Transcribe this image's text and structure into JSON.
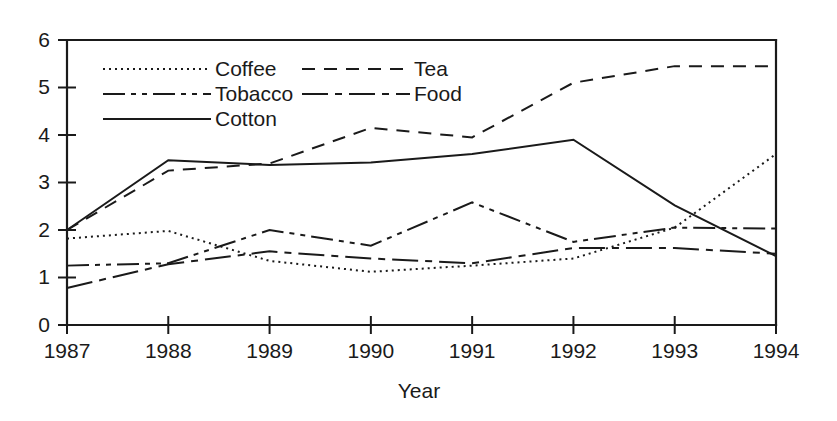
{
  "chart_data": {
    "type": "line",
    "title": "",
    "xlabel": "Year",
    "ylabel": "",
    "xlim": [
      1987,
      1994
    ],
    "ylim": [
      0,
      6
    ],
    "grid": false,
    "legend_position": "top-left inside plot",
    "categories": [
      "1987",
      "1988",
      "1989",
      "1990",
      "1991",
      "1992",
      "1993",
      "1994"
    ],
    "x": [
      1987,
      1988,
      1989,
      1990,
      1991,
      1992,
      1993,
      1994
    ],
    "yticks": [
      "0",
      "1",
      "2",
      "3",
      "4",
      "5",
      "6"
    ],
    "series": [
      {
        "name": "Coffee",
        "style": "dotted",
        "values": [
          1.82,
          1.98,
          1.35,
          1.12,
          1.25,
          1.4,
          2.05,
          3.6
        ]
      },
      {
        "name": "Tea",
        "style": "dashed",
        "values": [
          2.0,
          3.25,
          3.4,
          4.15,
          3.95,
          5.1,
          5.45,
          5.45
        ]
      },
      {
        "name": "Tobacco",
        "style": "dash-dot-dot",
        "values": [
          1.25,
          1.3,
          2.0,
          1.67,
          2.58,
          1.75,
          2.05,
          2.03
        ]
      },
      {
        "name": "Food",
        "style": "dash-dot",
        "values": [
          0.78,
          1.28,
          1.55,
          1.4,
          1.3,
          1.62,
          1.62,
          1.5
        ]
      },
      {
        "name": "Cotton",
        "style": "solid",
        "values": [
          2.0,
          3.47,
          3.37,
          3.42,
          3.6,
          3.9,
          2.52,
          1.45
        ]
      }
    ]
  },
  "axes": {
    "y_ticks": [
      {
        "label": "6",
        "value": 6
      },
      {
        "label": "5",
        "value": 5
      },
      {
        "label": "4",
        "value": 4
      },
      {
        "label": "3",
        "value": 3
      },
      {
        "label": "2",
        "value": 2
      },
      {
        "label": "1",
        "value": 1
      },
      {
        "label": "0",
        "value": 0
      }
    ],
    "x_ticks": [
      {
        "label": "1987",
        "value": 1987
      },
      {
        "label": "1988",
        "value": 1988
      },
      {
        "label": "1989",
        "value": 1989
      },
      {
        "label": "1990",
        "value": 1990
      },
      {
        "label": "1991",
        "value": 1991
      },
      {
        "label": "1992",
        "value": 1992
      },
      {
        "label": "1993",
        "value": 1993
      },
      {
        "label": "1994",
        "value": 1994
      }
    ],
    "x_axis_title": "Year"
  },
  "legend": {
    "entries": [
      {
        "label": "Coffee",
        "style": "dotted",
        "col": 0,
        "row": 0
      },
      {
        "label": "Tea",
        "style": "dashed",
        "col": 1,
        "row": 0
      },
      {
        "label": "Tobacco",
        "style": "dash-dot-dot",
        "col": 0,
        "row": 1
      },
      {
        "label": "Food",
        "style": "dash-dot",
        "col": 1,
        "row": 1
      },
      {
        "label": "Cotton",
        "style": "solid",
        "col": 0,
        "row": 2
      }
    ]
  },
  "colors": {
    "ink": "#1a1a1a",
    "background": "#ffffff"
  }
}
